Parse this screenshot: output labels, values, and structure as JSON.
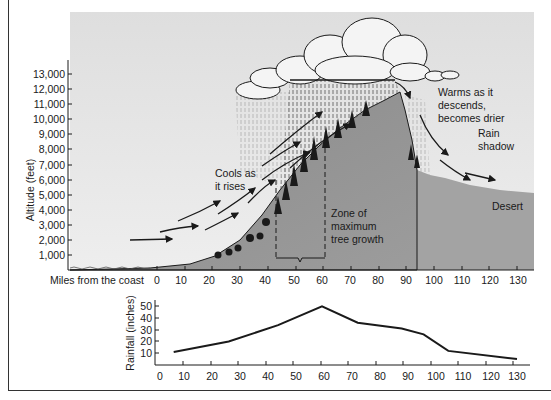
{
  "diagram": {
    "y_axis_label": "Altitude (feet)",
    "y_ticks": [
      "13,000",
      "12,000",
      "11,000",
      "10,000",
      "9,000",
      "8,000",
      "7,000",
      "6,000",
      "5,000",
      "4,000",
      "3,000",
      "2,000",
      "1,000"
    ],
    "x_axis_label": "Miles from the coast",
    "x_ticks": [
      "0",
      "10",
      "20",
      "30",
      "40",
      "50",
      "60",
      "70",
      "80",
      "90",
      "100",
      "110",
      "120",
      "130"
    ],
    "annotations": {
      "cools": [
        "Cools as",
        "it rises"
      ],
      "zone": [
        "Zone of",
        "maximum",
        "tree growth"
      ],
      "warms": [
        "Warms as it",
        "descends,",
        "becomes drier"
      ],
      "rain_shadow": [
        "Rain",
        "shadow"
      ],
      "desert": "Desert"
    },
    "colors": {
      "sky": "#e6e6e6",
      "mountain": "#8f8f8f",
      "desert": "#a3a3a3",
      "ink": "#1a1a1a"
    }
  },
  "chart_data": {
    "type": "line",
    "title": "",
    "xlabel": "",
    "ylabel": "Rainfall (inches)",
    "x": [
      5,
      25,
      43,
      59,
      72,
      88,
      96,
      105,
      130
    ],
    "series": [
      {
        "name": "Rainfall",
        "values": [
          11,
          20,
          34,
          50,
          36,
          31,
          26,
          12,
          5
        ]
      }
    ],
    "x_ticks": [
      "0",
      "10",
      "20",
      "30",
      "40",
      "50",
      "60",
      "70",
      "80",
      "90",
      "100",
      "110",
      "120",
      "130"
    ],
    "y_ticks": [
      "10",
      "20",
      "30",
      "40",
      "50"
    ],
    "xlim": [
      0,
      130
    ],
    "ylim": [
      0,
      55
    ],
    "grid": false,
    "legend": "none"
  }
}
